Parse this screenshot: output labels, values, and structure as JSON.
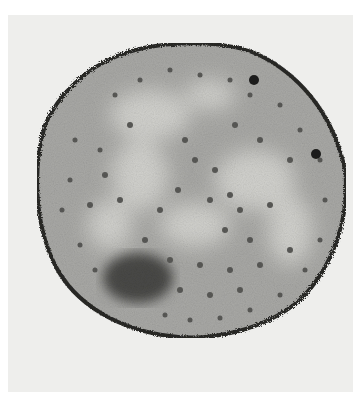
{
  "image": {
    "kind": "transmission electron micrograph",
    "subject": "cross-section of a round cell",
    "colors": {
      "background": "#ffffff",
      "frame": "#eeeeec",
      "cytoplasm": "#a9a9a6",
      "light_region": "#cfcfcb",
      "membrane": "#2a2a28",
      "granule": "#5a5a57",
      "dense_body": "#4a4a47"
    },
    "cell": {
      "cx": 185,
      "cy": 188,
      "rx": 155,
      "ry": 150
    },
    "features": [
      "dark membrane boundary",
      "ribosome-like granules",
      "light nucleoid regions",
      "dark dense body lower-left",
      "two dark inclusions upper-right edge"
    ]
  }
}
